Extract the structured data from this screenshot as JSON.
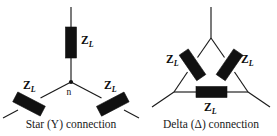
{
  "figure": {
    "background_color": "#ffffff",
    "line_color": "#1a1a1a",
    "component_color": "#111111",
    "width": 277,
    "height": 136
  },
  "diagrams": [
    {
      "id": "star",
      "caption": "Star (Y) connection",
      "symbol": "Y",
      "neutral_label": "n",
      "impedance_count": 3,
      "impedances": [
        {
          "id": "star-top",
          "label_z": "Z",
          "label_sub": "L",
          "orientation": "vertical"
        },
        {
          "id": "star-left",
          "label_z": "Z",
          "label_sub": "L",
          "orientation": "diagonal-down-left"
        },
        {
          "id": "star-right",
          "label_z": "Z",
          "label_sub": "L",
          "orientation": "diagonal-down-right"
        }
      ]
    },
    {
      "id": "delta",
      "caption": "Delta (Δ) connection",
      "symbol": "Δ",
      "impedance_count": 3,
      "impedances": [
        {
          "id": "delta-left",
          "label_z": "Z",
          "label_sub": "L",
          "orientation": "diagonal-left-side"
        },
        {
          "id": "delta-right",
          "label_z": "Z",
          "label_sub": "L",
          "orientation": "diagonal-right-side"
        },
        {
          "id": "delta-bottom",
          "label_z": "Z",
          "label_sub": "L",
          "orientation": "horizontal"
        }
      ]
    }
  ]
}
